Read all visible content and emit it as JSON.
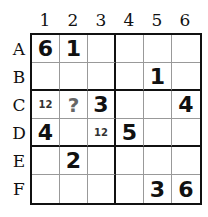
{
  "puzzle": {
    "columns": [
      "1",
      "2",
      "3",
      "4",
      "5",
      "6"
    ],
    "rows": [
      "A",
      "B",
      "C",
      "D",
      "E",
      "F"
    ],
    "cells": [
      [
        "6",
        "1",
        "",
        "",
        "",
        ""
      ],
      [
        "",
        "",
        "",
        "",
        "1",
        ""
      ],
      [
        "12",
        "?",
        "3",
        "",
        "",
        "4"
      ],
      [
        "4",
        "",
        "12",
        "5",
        "",
        ""
      ],
      [
        "",
        "2",
        "",
        "",
        "",
        ""
      ],
      [
        "",
        "",
        "",
        "",
        "3",
        "6"
      ]
    ],
    "cell_styles": [
      [
        "given",
        "given",
        "",
        "",
        "",
        ""
      ],
      [
        "",
        "",
        "",
        "",
        "given",
        ""
      ],
      [
        "small",
        "unknown",
        "given",
        "",
        "",
        "given"
      ],
      [
        "given",
        "",
        "small",
        "given",
        "",
        ""
      ],
      [
        "",
        "given",
        "",
        "",
        "",
        ""
      ],
      [
        "",
        "",
        "",
        "",
        "given",
        "given"
      ]
    ]
  }
}
